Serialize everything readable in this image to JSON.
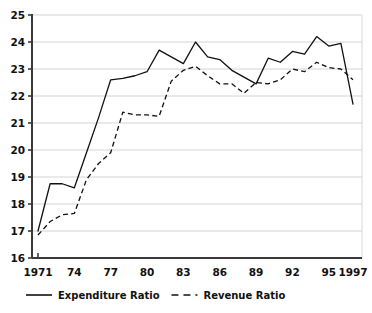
{
  "chart_data": {
    "type": "line",
    "title": "",
    "subtitle": "",
    "xlabel": "",
    "ylabel": "",
    "xlim": [
      1971,
      1997
    ],
    "ylim": [
      16,
      25
    ],
    "grid": "horizontal",
    "legend_position": "bottom-left",
    "x": [
      1971,
      1972,
      1973,
      1974,
      1975,
      1976,
      1977,
      1978,
      1979,
      1980,
      1981,
      1982,
      1983,
      1984,
      1985,
      1986,
      1987,
      1988,
      1989,
      1990,
      1991,
      1992,
      1993,
      1994,
      1995,
      1996,
      1997
    ],
    "x_tick_labels": [
      "1971",
      "74",
      "77",
      "80",
      "83",
      "86",
      "89",
      "92",
      "95",
      "1997"
    ],
    "x_tick_values": [
      1971,
      1974,
      1977,
      1980,
      1983,
      1986,
      1989,
      1992,
      1995,
      1997
    ],
    "y_tick_labels": [
      "16",
      "17",
      "18",
      "19",
      "20",
      "21",
      "22",
      "23",
      "24",
      "25"
    ],
    "y_tick_values": [
      16,
      17,
      18,
      19,
      20,
      21,
      22,
      23,
      24,
      25
    ],
    "series": [
      {
        "name": "Expenditure Ratio",
        "style": "solid",
        "color": "#111111",
        "values": [
          17.0,
          18.75,
          18.75,
          18.6,
          19.9,
          21.2,
          22.6,
          22.65,
          22.75,
          22.9,
          23.7,
          23.45,
          23.2,
          24.0,
          23.45,
          23.35,
          22.95,
          22.7,
          22.45,
          23.4,
          23.25,
          23.65,
          23.55,
          24.2,
          23.85,
          23.95,
          21.7
        ]
      },
      {
        "name": "Revenue Ratio",
        "style": "dashed",
        "color": "#111111",
        "values": [
          16.85,
          17.35,
          17.6,
          17.65,
          18.9,
          19.5,
          19.9,
          21.4,
          21.3,
          21.3,
          21.25,
          22.55,
          22.95,
          23.1,
          22.75,
          22.45,
          22.45,
          22.1,
          22.5,
          22.45,
          22.6,
          23.0,
          22.9,
          23.25,
          23.05,
          23.0,
          22.6
        ]
      }
    ],
    "legend": [
      {
        "label": "Expenditure Ratio",
        "style": "solid"
      },
      {
        "label": "Revenue Ratio",
        "style": "dashed"
      }
    ]
  }
}
